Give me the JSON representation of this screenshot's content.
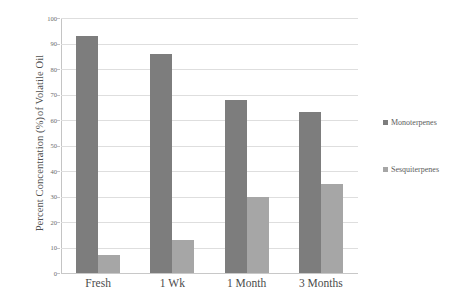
{
  "chart_data": {
    "type": "bar",
    "title": "",
    "subtitle": "",
    "xlabel": "",
    "ylabel": "Percent Concentration (%) of Volatile Oil",
    "ylabel_lines": [
      "Percent Concentration (%)",
      "of Volatile Oil"
    ],
    "categories": [
      "Fresh",
      "1 Wk",
      "1 Month",
      "3 Months"
    ],
    "series": [
      {
        "name": "Monoterpenes",
        "color": "#7d7d7d",
        "values": [
          93,
          86,
          68,
          63
        ]
      },
      {
        "name": "Sesquiterpenes",
        "color": "#a6a6a6",
        "values": [
          7,
          13,
          30,
          35
        ]
      }
    ],
    "ylim": [
      0,
      100
    ],
    "ytick_values": [
      0,
      10,
      20,
      30,
      40,
      50,
      60,
      70,
      80,
      90,
      100
    ],
    "ytick_labels": [
      "0",
      "10",
      "20",
      "30",
      "40",
      "50",
      "60",
      "70",
      "80",
      "90",
      "100"
    ],
    "grid": true,
    "grid_axis": "y",
    "legend_position": "right"
  },
  "legend": {
    "entries": [
      {
        "label": "Monoterpenes",
        "color": "#7d7d7d"
      },
      {
        "label": "Sesquiterpenes",
        "color": "#a6a6a6"
      }
    ]
  },
  "colors": {
    "background": "#ffffff",
    "gridline": "#dedede",
    "axis": "#c4c4c4",
    "text": "#5a5a5a",
    "series_monoterpenes": "#7d7d7d",
    "series_sesquiterpenes": "#a6a6a6"
  }
}
